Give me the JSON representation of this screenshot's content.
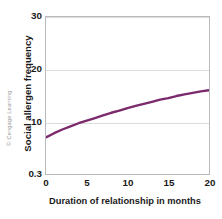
{
  "credit": "© Cengage Learning",
  "chart_data": {
    "type": "line",
    "title": "",
    "xlabel": "Duration of relationship in months",
    "ylabel": "Social allergen frequency",
    "xlim": [
      0,
      20
    ],
    "ylim": [
      0.3,
      30
    ],
    "xticks": [
      "0",
      "5",
      "10",
      "15",
      "20"
    ],
    "xtick_values": [
      0,
      5,
      10,
      15,
      20
    ],
    "yticks": [
      "0.3",
      "10",
      "20",
      "30"
    ],
    "ytick_values": [
      0.3,
      10,
      20,
      30
    ],
    "grid": "horizontal",
    "legend": "none",
    "series": [
      {
        "name": "Social allergen frequency",
        "color": "#7B2A6B",
        "x": [
          0,
          1,
          2,
          3,
          4,
          5,
          6,
          7,
          8,
          9,
          10,
          11,
          12,
          13,
          14,
          15,
          16,
          17,
          18,
          19,
          20
        ],
        "values": [
          7.0,
          7.8,
          8.5,
          9.1,
          9.7,
          10.2,
          10.7,
          11.2,
          11.7,
          12.1,
          12.6,
          13.0,
          13.4,
          13.8,
          14.2,
          14.5,
          14.9,
          15.2,
          15.5,
          15.8,
          16.0
        ]
      }
    ]
  }
}
